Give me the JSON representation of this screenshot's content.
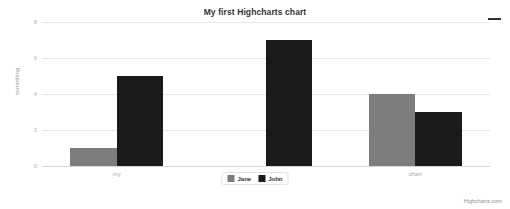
{
  "chart_data": {
    "type": "bar",
    "title": "My first Highcharts chart",
    "subtitle": "",
    "xlabel": "",
    "ylabel": "something",
    "categories": [
      "my",
      "first",
      "chart"
    ],
    "series": [
      {
        "name": "Jane",
        "color": "#7d7d7d",
        "values": [
          1,
          0,
          4
        ]
      },
      {
        "name": "John",
        "color": "#1a1a1a",
        "values": [
          5,
          7,
          3
        ]
      }
    ],
    "yticks": [
      0,
      2,
      4,
      6,
      8
    ],
    "ylim": [
      0,
      8
    ],
    "grid": true,
    "legend_position": "bottom"
  },
  "toolbar": {
    "export_menu_label": "menu-icon"
  },
  "credits": {
    "text": "Highcharts.com"
  }
}
